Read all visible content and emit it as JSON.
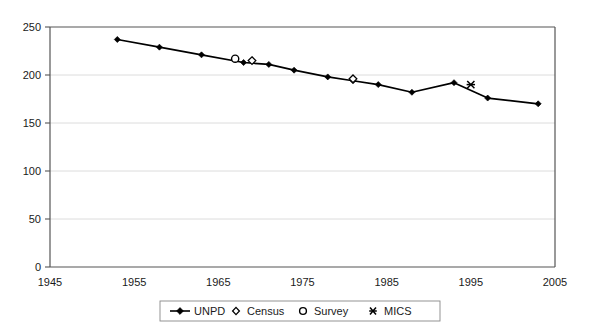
{
  "chart_data": {
    "type": "line",
    "title": "",
    "xlabel": "",
    "ylabel": "",
    "xlim": [
      1945,
      2005
    ],
    "ylim": [
      0,
      250
    ],
    "xticks": [
      1945,
      1955,
      1965,
      1975,
      1985,
      1995,
      2005
    ],
    "yticks": [
      0,
      50,
      100,
      150,
      200,
      250
    ],
    "grid": true,
    "legend_position": "bottom-center",
    "series": [
      {
        "name": "UNPD",
        "marker": "filled-diamond",
        "line": true,
        "x": [
          1953,
          1958,
          1963,
          1968,
          1971,
          1974,
          1978,
          1981,
          1984,
          1988,
          1993,
          1997,
          2003
        ],
        "y": [
          237,
          229,
          221,
          213,
          211,
          205,
          198,
          194,
          190,
          182,
          192,
          176,
          170
        ]
      },
      {
        "name": "Census",
        "marker": "open-diamond",
        "line": false,
        "x": [
          1969,
          1981
        ],
        "y": [
          215,
          196
        ]
      },
      {
        "name": "Survey",
        "marker": "open-circle",
        "line": false,
        "x": [
          1967
        ],
        "y": [
          217
        ]
      },
      {
        "name": "MICS",
        "marker": "asterisk",
        "line": false,
        "x": [
          1995
        ],
        "y": [
          190
        ]
      }
    ]
  },
  "axes": {
    "y_tick_labels": [
      "250",
      "200",
      "150",
      "100",
      "50",
      "0"
    ],
    "x_tick_labels": [
      "1945",
      "1955",
      "1965",
      "1975",
      "1985",
      "1995",
      "2005"
    ]
  },
  "legend": {
    "items": [
      {
        "label": "UNPD",
        "marker": "line-with-filled-diamond"
      },
      {
        "label": "Census",
        "marker": "open-diamond"
      },
      {
        "label": "Survey",
        "marker": "open-circle"
      },
      {
        "label": "MICS",
        "marker": "asterisk"
      }
    ]
  },
  "colors": {
    "series": "#000000",
    "grid": "#d8d8d8",
    "axis": "#555555",
    "background": "#ffffff"
  }
}
